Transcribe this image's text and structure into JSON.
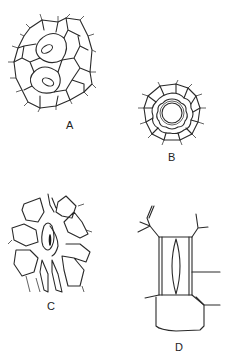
{
  "figure": {
    "panels": [
      {
        "label": "A",
        "description": "epidermal cells surrounding two stomata"
      },
      {
        "label": "B",
        "description": "stoma surrounded by concentric rings of subsidiary cells"
      },
      {
        "label": "C",
        "description": "stoma with radiating subsidiary cells"
      },
      {
        "label": "D",
        "description": "stoma between rectangular parallel subsidiary cells"
      }
    ],
    "colors": {
      "line": "#2a2a2a",
      "background": "#ffffff"
    }
  }
}
